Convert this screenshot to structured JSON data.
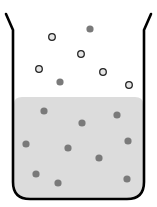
{
  "diagram": {
    "title": "",
    "colors": {
      "background": "#ffffff",
      "beaker_outline": "#000000",
      "liquid_fill": "#dcdcdc",
      "filled_particle": "#7a7a7a",
      "hollow_particle_fill": "#e6e6e6",
      "hollow_particle_stroke": "#222222"
    },
    "liquid_surface_y": 97,
    "gas_particles": [
      {
        "x": 52,
        "y": 37,
        "type": "hollow"
      },
      {
        "x": 90,
        "y": 29,
        "type": "filled"
      },
      {
        "x": 81,
        "y": 54,
        "type": "hollow"
      },
      {
        "x": 39,
        "y": 69,
        "type": "hollow"
      },
      {
        "x": 103,
        "y": 72,
        "type": "hollow"
      },
      {
        "x": 60,
        "y": 82,
        "type": "filled"
      },
      {
        "x": 129,
        "y": 85,
        "type": "hollow"
      }
    ],
    "liquid_particles": [
      {
        "x": 44,
        "y": 111,
        "type": "filled"
      },
      {
        "x": 117,
        "y": 115,
        "type": "filled"
      },
      {
        "x": 82,
        "y": 123,
        "type": "filled"
      },
      {
        "x": 26,
        "y": 144,
        "type": "filled"
      },
      {
        "x": 128,
        "y": 141,
        "type": "filled"
      },
      {
        "x": 68,
        "y": 148,
        "type": "filled"
      },
      {
        "x": 99,
        "y": 158,
        "type": "filled"
      },
      {
        "x": 36,
        "y": 174,
        "type": "filled"
      },
      {
        "x": 58,
        "y": 183,
        "type": "filled"
      },
      {
        "x": 127,
        "y": 179,
        "type": "filled"
      }
    ]
  }
}
